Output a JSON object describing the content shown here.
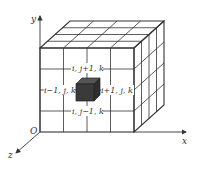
{
  "diagram": {
    "axes": {
      "x_label": "x",
      "y_label": "y",
      "z_label": "z",
      "origin_label": "O"
    },
    "cube_grid": {
      "divisions": 4,
      "line_color": "#333333",
      "center_cell_color": "#3a3a3a"
    },
    "neighbor_labels": {
      "top": "i, j+1, k",
      "left": "i−1, j, k",
      "right": "i+1, j, k",
      "bottom": "i, j−1, k"
    }
  }
}
